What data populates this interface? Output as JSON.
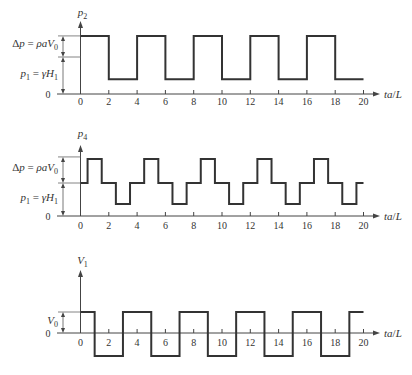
{
  "figure": {
    "background": "#ffffff",
    "line_color": "#333333",
    "panel_count": 3
  },
  "chart_data": [
    {
      "type": "line",
      "style": "step",
      "title": "",
      "ylabel_text": "p2",
      "ylabel": [
        {
          "t": "p",
          "italic": true
        },
        {
          "t": "2",
          "sub": true
        }
      ],
      "xlabel_text": "ta/L",
      "xlabel": [
        {
          "t": "ta",
          "italic": true
        },
        {
          "t": "/"
        },
        {
          "t": "L",
          "italic": true
        }
      ],
      "xticks": [
        0,
        2,
        4,
        6,
        8,
        10,
        12,
        14,
        16,
        18,
        20
      ],
      "xlim": [
        -1.6,
        21
      ],
      "ylim": [
        0,
        1.9
      ],
      "y_zero_label": "0",
      "grid": false,
      "legend": "none",
      "series": [
        {
          "name": "p2",
          "points": [
            [
              0,
              1.57
            ],
            [
              2,
              0.4
            ],
            [
              4,
              1.57
            ],
            [
              6,
              0.4
            ],
            [
              8,
              1.57
            ],
            [
              10,
              0.4
            ],
            [
              12,
              1.57
            ],
            [
              14,
              0.4
            ],
            [
              16,
              1.57
            ],
            [
              18,
              0.4
            ],
            [
              20,
              0.4
            ]
          ]
        }
      ],
      "annotations": [
        {
          "from": 0,
          "to": 1.0,
          "label_text": "p1 = γH1",
          "label": [
            {
              "t": "p",
              "italic": true
            },
            {
              "t": "1",
              "sub": true
            },
            {
              "t": " = "
            },
            {
              "t": "γH",
              "italic": true
            },
            {
              "t": "1",
              "sub": true
            }
          ]
        },
        {
          "from": 1.0,
          "to": 1.57,
          "label_text": "Δp = ρaV0",
          "label": [
            {
              "t": "Δ"
            },
            {
              "t": "p",
              "italic": true
            },
            {
              "t": " = "
            },
            {
              "t": "ρaV",
              "italic": true
            },
            {
              "t": "0",
              "sub": true
            }
          ]
        }
      ]
    },
    {
      "type": "line",
      "style": "step",
      "title": "",
      "ylabel_text": "p4",
      "ylabel": [
        {
          "t": "p",
          "italic": true
        },
        {
          "t": "4",
          "sub": true
        }
      ],
      "xlabel_text": "ta/L",
      "xlabel": [
        {
          "t": "ta",
          "italic": true
        },
        {
          "t": "/"
        },
        {
          "t": "L",
          "italic": true
        }
      ],
      "xticks": [
        0,
        2,
        4,
        6,
        8,
        10,
        12,
        14,
        16,
        18,
        20
      ],
      "xlim": [
        -1.6,
        21
      ],
      "ylim": [
        0,
        2.1
      ],
      "y_zero_label": "0",
      "grid": false,
      "legend": "none",
      "series": [
        {
          "name": "p4",
          "points": [
            [
              0,
              1.0
            ],
            [
              0.5,
              1.73
            ],
            [
              1.5,
              1.0
            ],
            [
              2.5,
              0.36
            ],
            [
              3.5,
              1.0
            ],
            [
              4.5,
              1.73
            ],
            [
              5.5,
              1.0
            ],
            [
              6.5,
              0.36
            ],
            [
              7.5,
              1.0
            ],
            [
              8.5,
              1.73
            ],
            [
              9.5,
              1.0
            ],
            [
              10.5,
              0.36
            ],
            [
              11.5,
              1.0
            ],
            [
              12.5,
              1.73
            ],
            [
              13.5,
              1.0
            ],
            [
              14.5,
              0.36
            ],
            [
              15.5,
              1.0
            ],
            [
              16.5,
              1.73
            ],
            [
              17.5,
              1.0
            ],
            [
              18.5,
              0.36
            ],
            [
              19.5,
              1.0
            ],
            [
              20,
              1.0
            ]
          ]
        }
      ],
      "annotations": [
        {
          "from": 0,
          "to": 1.0,
          "label_text": "p1 = γH1",
          "label": [
            {
              "t": "p",
              "italic": true
            },
            {
              "t": "1",
              "sub": true
            },
            {
              "t": " = "
            },
            {
              "t": "γH",
              "italic": true
            },
            {
              "t": "1",
              "sub": true
            }
          ]
        },
        {
          "from": 1.0,
          "to": 1.79,
          "label_text": "Δp = ρaV0",
          "label": [
            {
              "t": "Δ"
            },
            {
              "t": "p",
              "italic": true
            },
            {
              "t": " = "
            },
            {
              "t": "ρaV",
              "italic": true
            },
            {
              "t": "0",
              "sub": true
            }
          ]
        }
      ]
    },
    {
      "type": "line",
      "style": "step",
      "title": "",
      "ylabel_text": "V1",
      "ylabel": [
        {
          "t": "V",
          "italic": true
        },
        {
          "t": "1",
          "sub": true
        }
      ],
      "xlabel_text": "ta/L",
      "xlabel": [
        {
          "t": "ta",
          "italic": true
        },
        {
          "t": "/"
        },
        {
          "t": "L",
          "italic": true
        }
      ],
      "xticks": [
        0,
        2,
        4,
        6,
        8,
        10,
        12,
        14,
        16,
        18,
        20
      ],
      "xlim": [
        -1.6,
        21
      ],
      "ylim": [
        -1.2,
        3.0
      ],
      "y_zero_label": "0",
      "grid": false,
      "legend": "none",
      "series": [
        {
          "name": "V1",
          "points": [
            [
              0,
              1.0
            ],
            [
              1,
              -1.1
            ],
            [
              3,
              1.0
            ],
            [
              5,
              -1.1
            ],
            [
              7,
              1.0
            ],
            [
              9,
              -1.1
            ],
            [
              11,
              1.0
            ],
            [
              13,
              -1.1
            ],
            [
              15,
              1.0
            ],
            [
              17,
              -1.1
            ],
            [
              19,
              1.0
            ],
            [
              20,
              1.0
            ]
          ]
        }
      ],
      "annotations": [
        {
          "from": 0,
          "to": 1.0,
          "label_text": "V0",
          "label": [
            {
              "t": "V",
              "italic": true
            },
            {
              "t": "0",
              "sub": true
            }
          ]
        }
      ]
    }
  ]
}
